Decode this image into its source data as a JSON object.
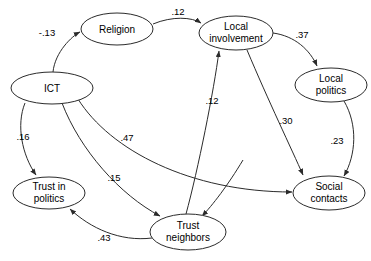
{
  "diagram": {
    "type": "path-diagram",
    "title": "",
    "background_color": "#ffffff",
    "stroke_color": "#2b2b2b",
    "text_color": "#000000",
    "nodes": [
      {
        "id": "religion",
        "label": "Religion",
        "label_line1": "Religion",
        "label_line2": "",
        "cx": 117,
        "cy": 29,
        "rx": 36,
        "ry": 16
      },
      {
        "id": "local-involvement",
        "label": "Local involvement",
        "label_line1": "Local",
        "label_line2": "involvement",
        "cx": 236,
        "cy": 33,
        "rx": 37,
        "ry": 17
      },
      {
        "id": "ict",
        "label": "ICT",
        "label_line1": "ICT",
        "label_line2": "",
        "cx": 52,
        "cy": 88,
        "rx": 41,
        "ry": 16
      },
      {
        "id": "local-politics",
        "label": "Local politics",
        "label_line1": "Local",
        "label_line2": "politics",
        "cx": 331,
        "cy": 85,
        "rx": 36,
        "ry": 17
      },
      {
        "id": "trust-in-politics",
        "label": "Trust in politics",
        "label_line1": "Trust in",
        "label_line2": "politics",
        "cx": 49,
        "cy": 193,
        "rx": 36,
        "ry": 16
      },
      {
        "id": "social-contacts",
        "label": "Social contacts",
        "label_line1": "Social",
        "label_line2": "contacts",
        "cx": 329,
        "cy": 193,
        "rx": 36,
        "ry": 17
      },
      {
        "id": "trust-neighbors",
        "label": "Trust neighbors",
        "label_line1": "Trust",
        "label_line2": "neighbors",
        "cx": 188,
        "cy": 232,
        "rx": 38,
        "ry": 18
      }
    ],
    "edges": [
      {
        "id": "ict-to-religion",
        "from": "ict",
        "to": "religion",
        "label": "-.13",
        "label_x": 47,
        "label_y": 33
      },
      {
        "id": "religion-to-local-involvement",
        "from": "religion",
        "to": "local-involvement",
        "label": ".12",
        "label_x": 178,
        "label_y": 12
      },
      {
        "id": "local-involvement-to-local-politics",
        "from": "local-involvement",
        "to": "local-politics",
        "label": ".37",
        "label_x": 302,
        "label_y": 35
      },
      {
        "id": "trust-neighbors-to-local-involvement",
        "from": "trust-neighbors",
        "to": "local-involvement",
        "label": ".12",
        "label_x": 212,
        "label_y": 101
      },
      {
        "id": "local-involvement-to-social-contacts",
        "from": "local-involvement",
        "to": "social-contacts",
        "label": ".30",
        "label_x": 286,
        "label_y": 121
      },
      {
        "id": "local-politics-to-social-contacts",
        "from": "local-politics",
        "to": "social-contacts",
        "label": ".23",
        "label_x": 337,
        "label_y": 141
      },
      {
        "id": "ict-to-trust-in-politics",
        "from": "ict",
        "to": "trust-in-politics",
        "label": ".16",
        "label_x": 23,
        "label_y": 137
      },
      {
        "id": "ict-to-social-contacts",
        "from": "ict",
        "to": "social-contacts",
        "label": ".47",
        "label_x": 127,
        "label_y": 138
      },
      {
        "id": "ict-to-trust-neighbors",
        "from": "ict",
        "to": "trust-neighbors",
        "label": ".15",
        "label_x": 114,
        "label_y": 178
      },
      {
        "id": "trust-neighbors-to-trust-in-politics",
        "from": "trust-neighbors",
        "to": "trust-in-politics",
        "label": ".43",
        "label_x": 104,
        "label_y": 238
      }
    ]
  }
}
